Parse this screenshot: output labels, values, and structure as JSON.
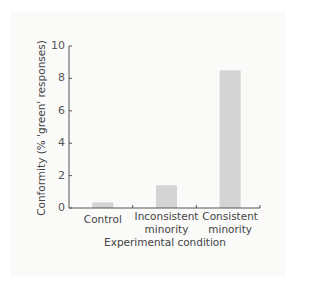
{
  "chart_data": {
    "type": "bar",
    "title": "",
    "categories": [
      "Control",
      "Inconsistent minority",
      "Consistent minority"
    ],
    "category_lines": [
      [
        "Control"
      ],
      [
        "Inconsistent",
        "minority"
      ],
      [
        "Consistent",
        "minority"
      ]
    ],
    "values": [
      0.35,
      1.4,
      8.5
    ],
    "xlabel": "Experimental condition",
    "ylabel": "Conformity (% 'green' responses)",
    "ylim": [
      0,
      10
    ],
    "yticks": [
      0,
      2,
      4,
      6,
      8,
      10
    ],
    "grid": false,
    "legend": null,
    "bar_color": "#d4d4d4",
    "axis_color": "#555555"
  }
}
